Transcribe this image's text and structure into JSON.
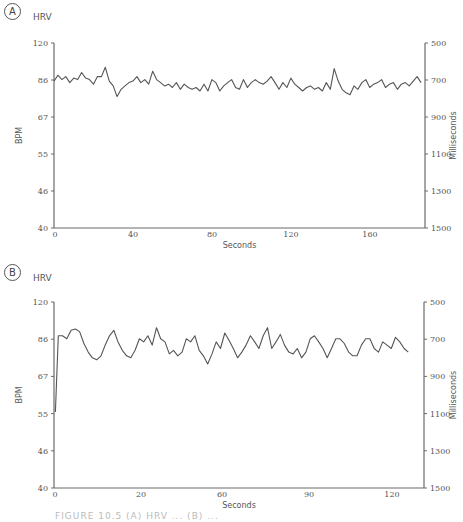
{
  "panels": [
    {
      "label": "A",
      "title": "HRV",
      "left_axis_label": "BPM",
      "right_axis_label": "Milliseconds",
      "x_axis_label": "Seconds"
    },
    {
      "label": "B",
      "title": "HRV",
      "left_axis_label": "BPM",
      "right_axis_label": "Milliseconds",
      "x_axis_label": "Seconds"
    }
  ],
  "caption": "FIGURE 10.5 (A) HRV ... (B) ...",
  "chart_data": [
    {
      "type": "line",
      "title": "HRV",
      "panel": "A",
      "xlabel": "Seconds",
      "ylabel": "BPM",
      "ylabel_right": "Milliseconds",
      "x_ticks": [
        0,
        40,
        80,
        120,
        160
      ],
      "y_ticks_left": [
        120,
        86,
        67,
        55,
        46,
        40
      ],
      "y_ticks_right": [
        500,
        700,
        900,
        1100,
        1300,
        1500
      ],
      "xlim": [
        0,
        188
      ],
      "ylim_ms": [
        500,
        1500
      ],
      "grid": false,
      "series": [
        {
          "name": "Heart rate",
          "x": [
            0,
            2,
            4,
            6,
            8,
            10,
            12,
            14,
            16,
            18,
            20,
            22,
            24,
            26,
            28,
            30,
            32,
            34,
            36,
            38,
            40,
            42,
            44,
            46,
            48,
            50,
            52,
            54,
            56,
            58,
            60,
            62,
            64,
            66,
            68,
            70,
            72,
            74,
            76,
            78,
            80,
            82,
            84,
            86,
            88,
            90,
            92,
            94,
            96,
            98,
            100,
            102,
            104,
            106,
            108,
            110,
            112,
            114,
            116,
            118,
            120,
            122,
            124,
            126,
            128,
            130,
            132,
            134,
            136,
            138,
            140,
            142,
            144,
            146,
            148,
            150,
            152,
            154,
            156,
            158,
            160,
            162,
            164,
            166,
            168,
            170,
            172,
            174,
            176,
            178,
            180,
            182,
            184,
            186
          ],
          "values": [
            85,
            89,
            86,
            88,
            84,
            87,
            86,
            91,
            87,
            86,
            83,
            88,
            88,
            95,
            85,
            82,
            76,
            80,
            82,
            84,
            85,
            88,
            84,
            86,
            83,
            92,
            86,
            84,
            82,
            83,
            81,
            84,
            80,
            83,
            81,
            80,
            81,
            79,
            83,
            79,
            86,
            84,
            79,
            82,
            84,
            86,
            81,
            80,
            86,
            81,
            84,
            86,
            84,
            83,
            85,
            88,
            84,
            80,
            84,
            81,
            87,
            83,
            81,
            79,
            81,
            82,
            80,
            81,
            79,
            84,
            80,
            94,
            85,
            80,
            78,
            77,
            82,
            80,
            84,
            86,
            81,
            83,
            84,
            86,
            81,
            83,
            84,
            80,
            83,
            84,
            82,
            85,
            88,
            84
          ]
        }
      ]
    },
    {
      "type": "line",
      "title": "HRV",
      "panel": "B",
      "xlabel": "Seconds",
      "ylabel": "BPM",
      "ylabel_right": "Milliseconds",
      "x_ticks": [
        0,
        20,
        60,
        90,
        120
      ],
      "y_ticks_left": [
        120,
        86,
        67,
        55,
        46,
        40
      ],
      "y_ticks_right": [
        500,
        700,
        900,
        1100,
        1300,
        1500
      ],
      "xlim": [
        0,
        130
      ],
      "ylim_ms": [
        500,
        1500
      ],
      "grid": false,
      "series": [
        {
          "name": "Heart rate",
          "x": [
            0.5,
            1.5,
            3,
            4.5,
            6,
            7.5,
            9,
            10.5,
            12,
            13.5,
            15,
            16.5,
            18,
            19.5,
            21,
            22.5,
            24,
            25.5,
            27,
            28.5,
            30,
            31.5,
            33,
            34.5,
            36,
            37.5,
            39,
            40.5,
            42,
            43.5,
            45,
            46.5,
            48,
            49.5,
            51,
            52.5,
            54,
            55.5,
            57,
            58.5,
            60,
            61.5,
            63,
            64.5,
            66,
            67.5,
            69,
            70.5,
            72,
            73.5,
            75,
            76.5,
            78,
            79.5,
            81,
            82.5,
            84,
            85.5,
            87,
            88.5,
            90,
            91.5,
            93,
            94.5,
            96,
            97.5,
            99,
            100.5,
            102,
            103.5,
            105,
            106.5,
            108,
            109.5,
            111,
            112.5,
            114,
            115.5,
            117,
            118.5,
            120,
            121.5,
            123,
            124.5
          ],
          "values": [
            55,
            88,
            88,
            86,
            92,
            93,
            91,
            83,
            78,
            75,
            74,
            76,
            82,
            88,
            92,
            84,
            79,
            76,
            75,
            79,
            86,
            84,
            88,
            82,
            94,
            86,
            84,
            77,
            79,
            76,
            78,
            86,
            84,
            88,
            79,
            76,
            72,
            77,
            84,
            80,
            90,
            85,
            80,
            75,
            78,
            82,
            88,
            84,
            80,
            88,
            94,
            80,
            84,
            89,
            82,
            78,
            77,
            80,
            75,
            78,
            86,
            88,
            84,
            80,
            75,
            80,
            86,
            86,
            83,
            78,
            76,
            76,
            82,
            86,
            86,
            80,
            78,
            84,
            82,
            80,
            87,
            84,
            80,
            78
          ]
        }
      ]
    }
  ]
}
